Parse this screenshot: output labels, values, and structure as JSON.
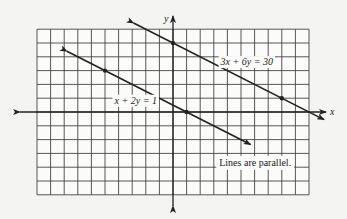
{
  "chart_data": {
    "type": "line",
    "title": "",
    "xlabel": "x",
    "ylabel": "y",
    "xlim": [
      -10,
      10
    ],
    "ylim": [
      -6,
      6
    ],
    "grid": true,
    "grid_step": 1,
    "series": [
      {
        "name": "x + 2y = 1",
        "equation": "x + 2y = 1",
        "x_range": [
          -7.8,
          5.7
        ],
        "points": [
          {
            "x": -5,
            "y": 3
          },
          {
            "x": 1,
            "y": 0
          }
        ],
        "slope": -0.5,
        "intercept": 0.5,
        "label_at": {
          "x": -4.3,
          "y": 0.6
        }
      },
      {
        "name": "3x + 6y = 30",
        "equation": "3x + 6y = 30",
        "x_range": [
          -2.9,
          11.1
        ],
        "points": [
          {
            "x": 0,
            "y": 5
          },
          {
            "x": 8,
            "y": 1
          }
        ],
        "slope": -0.5,
        "intercept": 5,
        "label_at": {
          "x": 3.5,
          "y": 3.4
        }
      }
    ],
    "annotations": [
      {
        "text": "Lines are parallel.",
        "x": 3.4,
        "y": -3.9
      }
    ],
    "colors": {
      "line": "#222222",
      "grid": "#444444",
      "background": "#f4f4f2"
    }
  }
}
